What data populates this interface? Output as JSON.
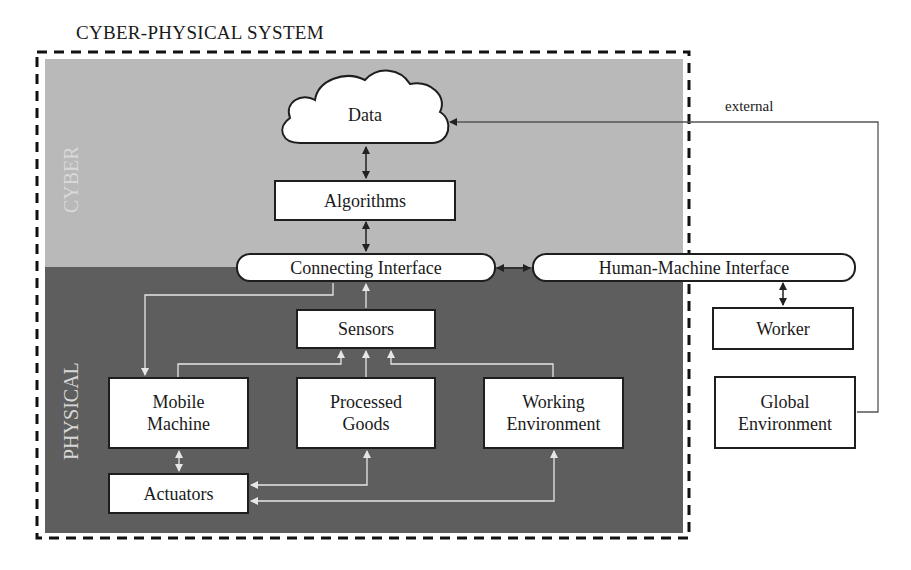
{
  "diagram": {
    "title": "CYBER-PHYSICAL SYSTEM",
    "regions": {
      "cyber": "CYBER",
      "physical": "PHYSICAL"
    },
    "nodes": {
      "data": "Data",
      "algorithms": "Algorithms",
      "connecting_interface": "Connecting Interface",
      "hmi": "Human-Machine Interface",
      "worker": "Worker",
      "global_environment": [
        "Global",
        "Environment"
      ],
      "sensors": "Sensors",
      "mobile_machine": [
        "Mobile",
        "Machine"
      ],
      "processed_goods": [
        "Processed",
        "Goods"
      ],
      "working_environment": [
        "Working",
        "Environment"
      ],
      "actuators": "Actuators"
    },
    "edge_labels": {
      "external": "external"
    },
    "edges": [
      {
        "from": "Data",
        "to": "Algorithms",
        "type": "bidirectional"
      },
      {
        "from": "Algorithms",
        "to": "Connecting Interface",
        "type": "bidirectional"
      },
      {
        "from": "Connecting Interface",
        "to": "Human-Machine Interface",
        "type": "bidirectional"
      },
      {
        "from": "Human-Machine Interface",
        "to": "Worker",
        "type": "bidirectional"
      },
      {
        "from": "Global Environment",
        "to": "Data",
        "type": "directed",
        "label": "external"
      },
      {
        "from": "Sensors",
        "to": "Connecting Interface",
        "type": "directed"
      },
      {
        "from": "Connecting Interface",
        "to": "Mobile Machine",
        "type": "directed"
      },
      {
        "from": "Mobile Machine",
        "to": "Sensors",
        "type": "directed"
      },
      {
        "from": "Processed Goods",
        "to": "Sensors",
        "type": "directed"
      },
      {
        "from": "Working Environment",
        "to": "Sensors",
        "type": "directed"
      },
      {
        "from": "Mobile Machine",
        "to": "Actuators",
        "type": "bidirectional"
      },
      {
        "from": "Actuators",
        "to": "Processed Goods",
        "type": "directed"
      },
      {
        "from": "Actuators",
        "to": "Working Environment",
        "type": "directed"
      }
    ]
  }
}
